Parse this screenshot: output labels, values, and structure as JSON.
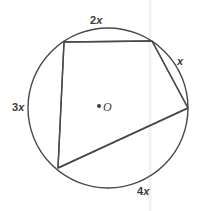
{
  "figure": {
    "type": "geometry-diagram",
    "width": 204,
    "height": 211,
    "background_color": "#ffffff",
    "stroke_color": "#444444",
    "text_color": "#3b3b3b"
  },
  "circle": {
    "center_label": "O",
    "center_x": 108,
    "center_y": 108,
    "radius": 80
  },
  "vertices": [
    {
      "name": "top-left",
      "x": 64,
      "y": 42
    },
    {
      "name": "top-right",
      "x": 152,
      "y": 41
    },
    {
      "name": "right",
      "x": 188,
      "y": 108
    },
    {
      "name": "bottom-left",
      "x": 58,
      "y": 168
    }
  ],
  "arc_labels": {
    "top": {
      "coefficient": "2",
      "variable": "x",
      "full": "2x"
    },
    "right": {
      "coefficient": "",
      "variable": "x",
      "full": "x"
    },
    "bottom": {
      "coefficient": "4",
      "variable": "x",
      "full": "4x"
    },
    "left": {
      "coefficient": "3",
      "variable": "x",
      "full": "3x"
    }
  },
  "artifact": {
    "faint_vertical_line_x": 150,
    "color": "#f4f4f4"
  }
}
